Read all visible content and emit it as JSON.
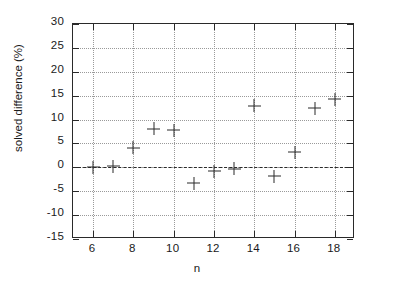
{
  "chart_data": {
    "type": "scatter",
    "title": "",
    "xlabel": "n",
    "ylabel": "solved difference (%)",
    "xlim": [
      5,
      19
    ],
    "ylim": [
      -15,
      30
    ],
    "grid": true,
    "legend": null,
    "marker": "plus",
    "marker_color": "#2b2b2b",
    "reference_line": {
      "y": 0,
      "style": "dashed",
      "color": "#2a2a2a"
    },
    "xticks": [
      6,
      8,
      10,
      12,
      14,
      16,
      18
    ],
    "xtick_labels": [
      "6",
      "8",
      "10",
      "12",
      "14",
      "16",
      "18"
    ],
    "yticks": [
      -15,
      -10,
      -5,
      0,
      5,
      10,
      15,
      20,
      25,
      30
    ],
    "ytick_labels": [
      "-15",
      "-10",
      "-5",
      "0",
      "5",
      "10",
      "15",
      "20",
      "25",
      "30"
    ],
    "x": [
      6,
      7,
      8,
      9,
      10,
      11,
      12,
      13,
      14,
      15,
      16,
      17,
      18
    ],
    "values": [
      0.0,
      0.2,
      4.1,
      8.1,
      7.8,
      -3.3,
      -0.8,
      -0.3,
      12.9,
      -1.9,
      3.2,
      12.4,
      14.2
    ],
    "points": [
      {
        "x": 6,
        "y": 0.0
      },
      {
        "x": 7,
        "y": 0.2
      },
      {
        "x": 8,
        "y": 4.1
      },
      {
        "x": 9,
        "y": 8.1
      },
      {
        "x": 10,
        "y": 7.8
      },
      {
        "x": 11,
        "y": -3.3
      },
      {
        "x": 12,
        "y": -0.8
      },
      {
        "x": 13,
        "y": -0.3
      },
      {
        "x": 14,
        "y": 12.9
      },
      {
        "x": 15,
        "y": -1.9
      },
      {
        "x": 16,
        "y": 3.2
      },
      {
        "x": 17,
        "y": 12.4
      },
      {
        "x": 18,
        "y": 14.2
      }
    ]
  }
}
